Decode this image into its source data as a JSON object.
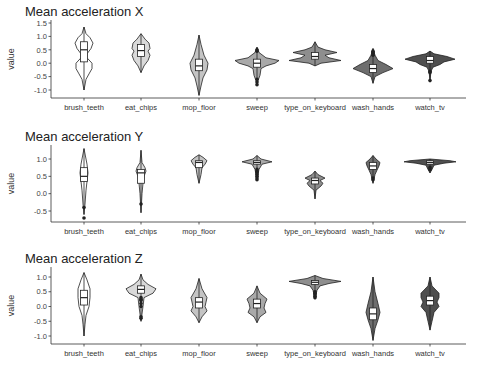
{
  "categories": [
    "brush_teeth",
    "eat_chips",
    "mop_floor",
    "sweep",
    "type_on_keyboard",
    "wash_hands",
    "watch_tv"
  ],
  "fill_colors": [
    "#ffffff",
    "#d9d9d9",
    "#c4c4c4",
    "#a9a9a9",
    "#8e8e8e",
    "#6e6e6e",
    "#4f4f4f"
  ],
  "y_label": "value",
  "chart_data": [
    {
      "type": "violin",
      "title": "Mean acceleration X",
      "xlabel": "",
      "ylabel": "value",
      "ylim": [
        -1.2,
        1.6
      ],
      "yticks": [
        1.5,
        1.0,
        0.5,
        0.0,
        -0.5,
        -1.0
      ],
      "ytick_labels": [
        "1.5",
        "1.0",
        "0.5",
        "0.0",
        "-0.5",
        "-1.0"
      ],
      "categories": [
        "brush_teeth",
        "eat_chips",
        "mop_floor",
        "sweep",
        "type_on_keyboard",
        "wash_hands",
        "watch_tv"
      ],
      "series": [
        {
          "name": "brush_teeth",
          "min": -1.0,
          "q1": 0.05,
          "median": 0.5,
          "q3": 0.8,
          "max": 1.35,
          "shape": [
            [
              1.35,
              0
            ],
            [
              1.1,
              2
            ],
            [
              0.95,
              6
            ],
            [
              0.75,
              9
            ],
            [
              0.55,
              7
            ],
            [
              0.35,
              3
            ],
            [
              0.2,
              3
            ],
            [
              0.0,
              8
            ],
            [
              -0.2,
              8
            ],
            [
              -0.4,
              5
            ],
            [
              -0.6,
              2
            ],
            [
              -1.0,
              0
            ]
          ],
          "outliers": []
        },
        {
          "name": "eat_chips",
          "min": -0.35,
          "q1": 0.25,
          "median": 0.47,
          "q3": 0.7,
          "max": 1.1,
          "shape": [
            [
              1.1,
              0
            ],
            [
              0.9,
              4
            ],
            [
              0.75,
              8
            ],
            [
              0.55,
              9
            ],
            [
              0.45,
              7
            ],
            [
              0.3,
              9
            ],
            [
              0.1,
              7
            ],
            [
              -0.1,
              3
            ],
            [
              -0.35,
              0
            ]
          ],
          "outliers": []
        },
        {
          "name": "mop_floor",
          "min": -1.2,
          "q1": -0.28,
          "median": -0.1,
          "q3": 0.15,
          "max": 1.05,
          "shape": [
            [
              1.05,
              0
            ],
            [
              0.7,
              2
            ],
            [
              0.3,
              5
            ],
            [
              0.0,
              9
            ],
            [
              -0.25,
              8
            ],
            [
              -0.55,
              4
            ],
            [
              -0.85,
              2
            ],
            [
              -1.2,
              0
            ]
          ],
          "outliers": []
        },
        {
          "name": "sweep",
          "min": -0.75,
          "q1": -0.15,
          "median": 0.0,
          "q3": 0.15,
          "max": 0.6,
          "shape": [
            [
              0.6,
              0
            ],
            [
              0.4,
              2
            ],
            [
              0.2,
              9
            ],
            [
              0.1,
              22
            ],
            [
              0.0,
              18
            ],
            [
              -0.1,
              9
            ],
            [
              -0.2,
              4
            ],
            [
              -0.45,
              3
            ],
            [
              -0.75,
              0
            ]
          ],
          "outliers": [
            -0.6,
            -0.7,
            -0.8,
            0.45,
            0.5
          ]
        },
        {
          "name": "type_on_keyboard",
          "min": -0.1,
          "q1": 0.15,
          "median": 0.25,
          "q3": 0.4,
          "max": 0.8,
          "shape": [
            [
              0.8,
              0
            ],
            [
              0.6,
              3
            ],
            [
              0.5,
              10
            ],
            [
              0.4,
              22
            ],
            [
              0.3,
              10
            ],
            [
              0.2,
              14
            ],
            [
              0.1,
              26
            ],
            [
              0.0,
              6
            ],
            [
              -0.1,
              0
            ]
          ],
          "outliers": []
        },
        {
          "name": "wash_hands",
          "min": -0.75,
          "q1": -0.35,
          "median": -0.2,
          "q3": -0.05,
          "max": 0.55,
          "shape": [
            [
              0.55,
              0
            ],
            [
              0.3,
              2
            ],
            [
              0.1,
              5
            ],
            [
              -0.05,
              13
            ],
            [
              -0.2,
              20
            ],
            [
              -0.35,
              10
            ],
            [
              -0.5,
              2
            ],
            [
              -0.75,
              0
            ]
          ],
          "outliers": [
            0.3,
            0.35,
            0.4,
            0.45
          ]
        },
        {
          "name": "watch_tv",
          "min": -0.65,
          "q1": 0.0,
          "median": 0.1,
          "q3": 0.25,
          "max": 0.45,
          "shape": [
            [
              0.45,
              0
            ],
            [
              0.35,
              4
            ],
            [
              0.25,
              17
            ],
            [
              0.15,
              25
            ],
            [
              0.05,
              14
            ],
            [
              -0.05,
              10
            ],
            [
              -0.15,
              3
            ],
            [
              -0.3,
              1
            ],
            [
              -0.65,
              0
            ]
          ],
          "outliers": [
            -0.3,
            -0.35,
            -0.65
          ]
        }
      ]
    },
    {
      "type": "violin",
      "title": "Mean acceleration Y",
      "xlabel": "",
      "ylabel": "value",
      "ylim": [
        -0.85,
        1.4
      ],
      "yticks": [
        1.0,
        0.5,
        0.0,
        -0.5
      ],
      "ytick_labels": [
        "1.0",
        "0.5",
        "0.0",
        "-0.5"
      ],
      "categories": [
        "brush_teeth",
        "eat_chips",
        "mop_floor",
        "sweep",
        "type_on_keyboard",
        "wash_hands",
        "watch_tv"
      ],
      "series": [
        {
          "name": "brush_teeth",
          "min": -0.6,
          "q1": 0.35,
          "median": 0.5,
          "q3": 0.75,
          "max": 1.3,
          "shape": [
            [
              1.3,
              0
            ],
            [
              1.0,
              2
            ],
            [
              0.85,
              3
            ],
            [
              0.6,
              4
            ],
            [
              0.35,
              3
            ],
            [
              0.1,
              2
            ],
            [
              -0.3,
              1
            ],
            [
              -0.6,
              0
            ]
          ],
          "outliers": [
            -0.4,
            -0.7
          ]
        },
        {
          "name": "eat_chips",
          "min": -0.55,
          "q1": 0.3,
          "median": 0.6,
          "q3": 0.7,
          "max": 1.25,
          "shape": [
            [
              1.25,
              0
            ],
            [
              0.9,
              1
            ],
            [
              0.75,
              4
            ],
            [
              0.65,
              5
            ],
            [
              0.5,
              3
            ],
            [
              0.3,
              2
            ],
            [
              0.0,
              1
            ],
            [
              -0.55,
              0
            ]
          ],
          "outliers": [
            -0.3
          ]
        },
        {
          "name": "mop_floor",
          "min": 0.3,
          "q1": 0.75,
          "median": 0.9,
          "q3": 0.95,
          "max": 1.12,
          "shape": [
            [
              1.12,
              0
            ],
            [
              1.05,
              4
            ],
            [
              0.95,
              8
            ],
            [
              0.85,
              6
            ],
            [
              0.75,
              3
            ],
            [
              0.55,
              2
            ],
            [
              0.3,
              0
            ]
          ],
          "outliers": []
        },
        {
          "name": "sweep",
          "min": 0.4,
          "q1": 0.85,
          "median": 0.9,
          "q3": 0.95,
          "max": 1.1,
          "shape": [
            [
              1.1,
              0
            ],
            [
              1.0,
              4
            ],
            [
              0.92,
              15
            ],
            [
              0.85,
              5
            ],
            [
              0.7,
              2
            ],
            [
              0.4,
              0
            ]
          ],
          "outliers": [
            0.4,
            0.45,
            0.5,
            0.55,
            0.6,
            0.65,
            0.7
          ]
        },
        {
          "name": "type_on_keyboard",
          "min": -0.15,
          "q1": 0.28,
          "median": 0.38,
          "q3": 0.45,
          "max": 0.65,
          "shape": [
            [
              0.65,
              0
            ],
            [
              0.55,
              3
            ],
            [
              0.45,
              10
            ],
            [
              0.38,
              5
            ],
            [
              0.3,
              8
            ],
            [
              0.22,
              6
            ],
            [
              0.1,
              1
            ],
            [
              -0.15,
              0
            ]
          ],
          "outliers": []
        },
        {
          "name": "wash_hands",
          "min": 0.3,
          "q1": 0.7,
          "median": 0.8,
          "q3": 0.9,
          "max": 1.1,
          "shape": [
            [
              1.1,
              0
            ],
            [
              1.0,
              3
            ],
            [
              0.9,
              7
            ],
            [
              0.8,
              6
            ],
            [
              0.68,
              4
            ],
            [
              0.55,
              2
            ],
            [
              0.3,
              0
            ]
          ],
          "outliers": [
            0.4,
            0.45
          ]
        },
        {
          "name": "watch_tv",
          "min": 0.6,
          "q1": 0.85,
          "median": 0.9,
          "q3": 0.95,
          "max": 1.0,
          "shape": [
            [
              1.0,
              0
            ],
            [
              0.95,
              20
            ],
            [
              0.92,
              26
            ],
            [
              0.88,
              14
            ],
            [
              0.82,
              4
            ],
            [
              0.7,
              2
            ],
            [
              0.6,
              0
            ]
          ],
          "outliers": [
            0.7,
            0.75
          ]
        }
      ]
    },
    {
      "type": "violin",
      "title": "Mean acceleration Z",
      "xlabel": "",
      "ylabel": "value",
      "ylim": [
        -1.2,
        1.35
      ],
      "yticks": [
        1.0,
        0.5,
        0.0,
        -0.5,
        -1.0
      ],
      "ytick_labels": [
        "1.0",
        "0.5",
        "0.0",
        "-0.5",
        "-1.0"
      ],
      "categories": [
        "brush_teeth",
        "eat_chips",
        "mop_floor",
        "sweep",
        "type_on_keyboard",
        "wash_hands",
        "watch_tv"
      ],
      "series": [
        {
          "name": "brush_teeth",
          "min": -1.0,
          "q1": 0.05,
          "median": 0.3,
          "q3": 0.55,
          "max": 1.15,
          "shape": [
            [
              1.15,
              0
            ],
            [
              0.9,
              3
            ],
            [
              0.6,
              6
            ],
            [
              0.3,
              6
            ],
            [
              0.0,
              5
            ],
            [
              -0.3,
              2
            ],
            [
              -0.6,
              1
            ],
            [
              -1.0,
              0
            ]
          ],
          "outliers": []
        },
        {
          "name": "eat_chips",
          "min": -0.5,
          "q1": 0.45,
          "median": 0.58,
          "q3": 0.7,
          "max": 1.1,
          "shape": [
            [
              1.1,
              0
            ],
            [
              0.9,
              2
            ],
            [
              0.75,
              7
            ],
            [
              0.6,
              15
            ],
            [
              0.45,
              12
            ],
            [
              0.3,
              3
            ],
            [
              0.0,
              2
            ],
            [
              -0.5,
              0
            ]
          ],
          "outliers": [
            -0.35,
            -0.4,
            0.0,
            0.1,
            0.2,
            0.25,
            0.3
          ]
        },
        {
          "name": "mop_floor",
          "min": -0.55,
          "q1": -0.05,
          "median": 0.15,
          "q3": 0.3,
          "max": 0.95,
          "shape": [
            [
              0.95,
              0
            ],
            [
              0.6,
              3
            ],
            [
              0.3,
              8
            ],
            [
              0.15,
              7
            ],
            [
              0.0,
              6
            ],
            [
              -0.15,
              8
            ],
            [
              -0.35,
              3
            ],
            [
              -0.55,
              0
            ]
          ],
          "outliers": []
        },
        {
          "name": "sweep",
          "min": -0.55,
          "q1": -0.05,
          "median": 0.1,
          "q3": 0.25,
          "max": 0.7,
          "shape": [
            [
              0.7,
              0
            ],
            [
              0.45,
              3
            ],
            [
              0.25,
              10
            ],
            [
              0.1,
              8
            ],
            [
              -0.05,
              7
            ],
            [
              -0.2,
              9
            ],
            [
              -0.35,
              3
            ],
            [
              -0.55,
              0
            ]
          ],
          "outliers": []
        },
        {
          "name": "type_on_keyboard",
          "min": 0.25,
          "q1": 0.75,
          "median": 0.82,
          "q3": 0.88,
          "max": 1.05,
          "shape": [
            [
              1.05,
              0
            ],
            [
              0.95,
              8
            ],
            [
              0.85,
              26
            ],
            [
              0.78,
              14
            ],
            [
              0.7,
              5
            ],
            [
              0.55,
              2
            ],
            [
              0.25,
              0
            ]
          ],
          "outliers": [
            0.3,
            0.35,
            0.4,
            0.45,
            0.5
          ]
        },
        {
          "name": "wash_hands",
          "min": -1.15,
          "q1": -0.45,
          "median": -0.25,
          "q3": -0.05,
          "max": 1.0,
          "shape": [
            [
              1.0,
              0
            ],
            [
              0.5,
              2
            ],
            [
              0.1,
              5
            ],
            [
              -0.2,
              7
            ],
            [
              -0.45,
              5
            ],
            [
              -0.75,
              2
            ],
            [
              -1.15,
              0
            ]
          ],
          "outliers": []
        },
        {
          "name": "watch_tv",
          "min": -0.8,
          "q1": 0.05,
          "median": 0.2,
          "q3": 0.35,
          "max": 1.0,
          "shape": [
            [
              1.0,
              0
            ],
            [
              0.7,
              2
            ],
            [
              0.45,
              9
            ],
            [
              0.3,
              9
            ],
            [
              0.15,
              7
            ],
            [
              0.0,
              9
            ],
            [
              -0.2,
              4
            ],
            [
              -0.5,
              2
            ],
            [
              -0.8,
              0
            ]
          ],
          "outliers": []
        }
      ]
    }
  ],
  "layout": {
    "panels": [
      {
        "title_y": 16,
        "top": 20,
        "bottom": 98,
        "y_of_first_tick": 23,
        "y_of_last_tick": 90
      },
      {
        "title_y": 141,
        "top": 145,
        "bottom": 222,
        "y_of_first_tick": 159,
        "y_of_last_tick": 211
      },
      {
        "title_y": 263,
        "top": 267,
        "bottom": 344,
        "y_of_first_tick": 277,
        "y_of_last_tick": 336
      }
    ],
    "x_axis_left": 51,
    "x_axis_right": 466,
    "category_x": [
      84,
      141,
      199,
      257,
      315,
      373,
      430
    ],
    "title_x": 51
  }
}
